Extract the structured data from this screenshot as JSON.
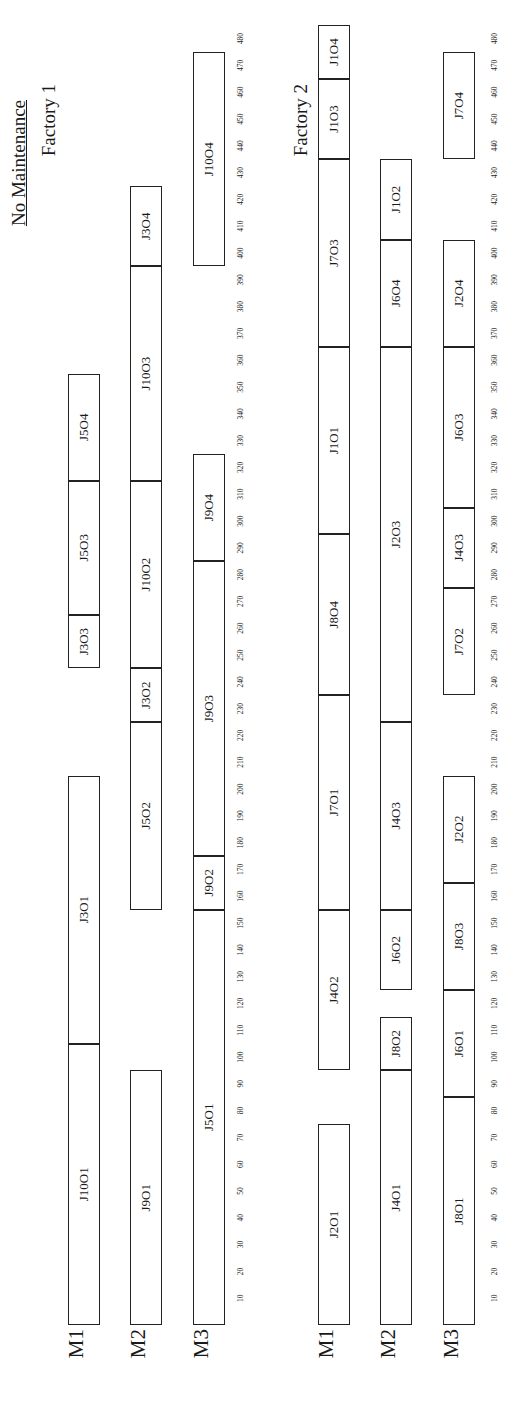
{
  "title": "No Maintenance",
  "chart_data": {
    "type": "gantt",
    "title": "No Maintenance",
    "xlabel": "",
    "ylabel": "",
    "x_ticks": [
      10,
      20,
      30,
      40,
      50,
      60,
      70,
      80,
      90,
      100,
      110,
      120,
      130,
      140,
      150,
      160,
      170,
      180,
      190,
      200,
      210,
      220,
      230,
      240,
      250,
      260,
      270,
      280,
      290,
      300,
      310,
      320,
      330,
      340,
      350,
      360,
      370,
      380,
      390,
      400,
      410,
      420,
      430,
      440,
      450,
      460,
      470,
      480
    ],
    "xlim": [
      0,
      485
    ],
    "rotation": "rotated 90 degrees counter-clockwise",
    "factories": [
      {
        "name": "Factory 1",
        "machines": [
          {
            "name": "M1",
            "tasks": [
              {
                "label": "J10O1",
                "start": 0,
                "end": 105
              },
              {
                "label": "J3O1",
                "start": 105,
                "end": 205
              },
              {
                "label": "J3O3",
                "start": 245,
                "end": 265
              },
              {
                "label": "J5O3",
                "start": 265,
                "end": 315
              },
              {
                "label": "J5O4",
                "start": 315,
                "end": 355
              }
            ]
          },
          {
            "name": "M2",
            "tasks": [
              {
                "label": "J9O1",
                "start": 0,
                "end": 95
              },
              {
                "label": "J5O2",
                "start": 155,
                "end": 225
              },
              {
                "label": "J3O2",
                "start": 225,
                "end": 245
              },
              {
                "label": "J10O2",
                "start": 245,
                "end": 315
              },
              {
                "label": "J10O3",
                "start": 315,
                "end": 395
              },
              {
                "label": "J3O4",
                "start": 395,
                "end": 425
              }
            ]
          },
          {
            "name": "M3",
            "tasks": [
              {
                "label": "J5O1",
                "start": 0,
                "end": 155
              },
              {
                "label": "J9O2",
                "start": 155,
                "end": 175
              },
              {
                "label": "J9O3",
                "start": 175,
                "end": 285
              },
              {
                "label": "J9O4",
                "start": 285,
                "end": 325
              },
              {
                "label": "J10O4",
                "start": 395,
                "end": 475
              }
            ]
          }
        ]
      },
      {
        "name": "Factory 2",
        "machines": [
          {
            "name": "M1",
            "tasks": [
              {
                "label": "J2O1",
                "start": 0,
                "end": 75
              },
              {
                "label": "J4O2",
                "start": 95,
                "end": 155
              },
              {
                "label": "J7O1",
                "start": 155,
                "end": 235
              },
              {
                "label": "J8O4",
                "start": 235,
                "end": 295
              },
              {
                "label": "J1O1",
                "start": 295,
                "end": 365
              },
              {
                "label": "J7O3",
                "start": 365,
                "end": 435
              },
              {
                "label": "J1O3",
                "start": 435,
                "end": 465
              },
              {
                "label": "J1O4",
                "start": 465,
                "end": 485
              }
            ]
          },
          {
            "name": "M2",
            "tasks": [
              {
                "label": "J4O1",
                "start": 0,
                "end": 95
              },
              {
                "label": "J8O2",
                "start": 95,
                "end": 115
              },
              {
                "label": "J6O2",
                "start": 125,
                "end": 155
              },
              {
                "label": "J4O3",
                "start": 155,
                "end": 225
              },
              {
                "label": "J2O3",
                "start": 225,
                "end": 365
              },
              {
                "label": "J6O4",
                "start": 365,
                "end": 405
              },
              {
                "label": "J1O2",
                "start": 405,
                "end": 435
              }
            ]
          },
          {
            "name": "M3",
            "tasks": [
              {
                "label": "J8O1",
                "start": 0,
                "end": 85
              },
              {
                "label": "J6O1",
                "start": 85,
                "end": 125
              },
              {
                "label": "J8O3",
                "start": 125,
                "end": 165
              },
              {
                "label": "J2O2",
                "start": 165,
                "end": 205
              },
              {
                "label": "J7O2",
                "start": 235,
                "end": 275
              },
              {
                "label": "J4O3",
                "start": 275,
                "end": 305
              },
              {
                "label": "J6O3",
                "start": 305,
                "end": 365
              },
              {
                "label": "J2O4",
                "start": 365,
                "end": 405
              },
              {
                "label": "J7O4",
                "start": 435,
                "end": 475
              }
            ]
          }
        ]
      }
    ]
  }
}
